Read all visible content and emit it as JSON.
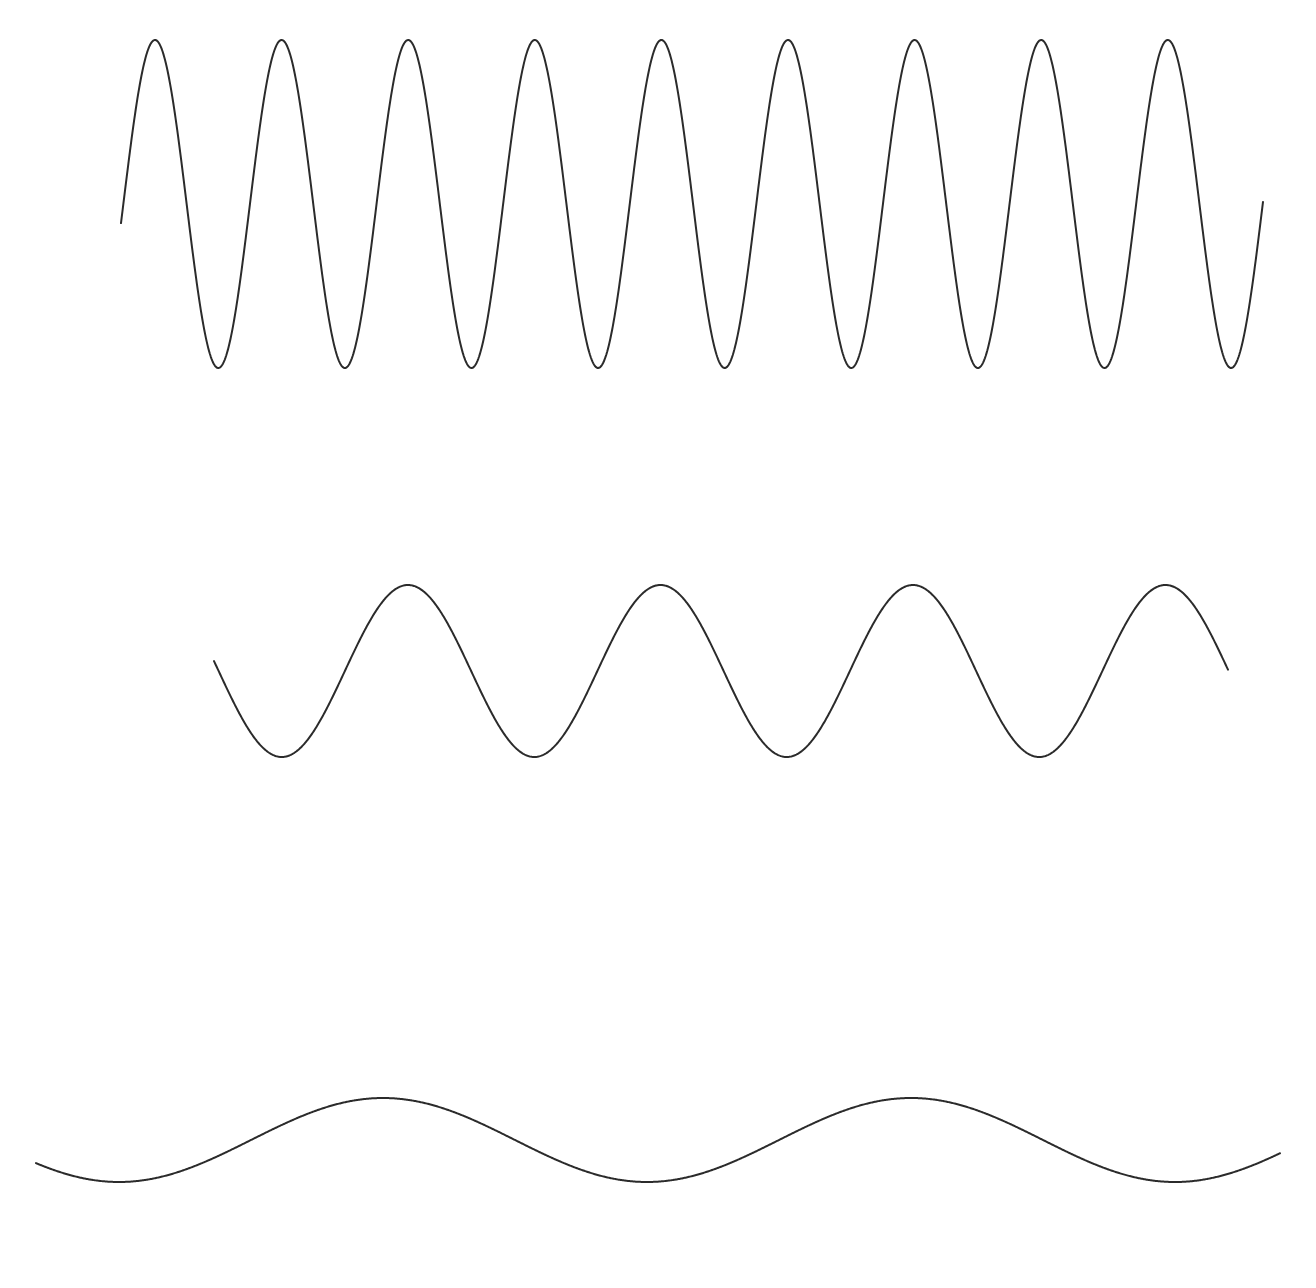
{
  "figure": {
    "background_color": "#ffffff",
    "width": 1316,
    "height": 1288
  },
  "chart_data": {
    "type": "line",
    "subtitle": "",
    "xlabel": "",
    "ylabel": "",
    "grid": false,
    "legend": "none",
    "axes_visible": false,
    "tick_labels": [],
    "annotations": [],
    "xlim": [
      0,
      1316
    ],
    "ylim": [
      0,
      1288
    ],
    "series": [
      {
        "name": "high-frequency-wave",
        "stroke_color": "#2b2b2b",
        "stroke_width": 2.0,
        "waveform": "sine",
        "x_start": 121,
        "x_end": 1263,
        "midline_y": 204,
        "amplitude": 164,
        "wavelength": 126.6,
        "first_peak_x": 155,
        "peak_count": 9,
        "peak_y": 41,
        "trough_y": 368,
        "peaks_x": [
          155,
          282,
          408,
          535,
          661,
          788,
          915,
          1041,
          1168
        ],
        "troughs_x": [
          218,
          345,
          471,
          598,
          725,
          851,
          978,
          1104,
          1231
        ],
        "samples": 1400
      },
      {
        "name": "mid-frequency-wave",
        "stroke_color": "#2b2b2b",
        "stroke_width": 2.0,
        "waveform": "sine",
        "x_start": 214,
        "x_end": 1228,
        "midline_y": 671,
        "amplitude": 86,
        "wavelength": 252.5,
        "first_peak_x": 408,
        "peak_count": 4,
        "peak_y": 585,
        "trough_y": 757,
        "peaks_x": [
          408,
          660,
          913,
          1165
        ],
        "troughs_x": [
          281,
          534,
          786,
          1039
        ],
        "samples": 1400
      },
      {
        "name": "low-frequency-wave",
        "stroke_color": "#2b2b2b",
        "stroke_width": 2.0,
        "waveform": "sine",
        "x_start": 36,
        "x_end": 1280,
        "midline_y": 1140,
        "amplitude": 42,
        "wavelength": 528,
        "first_peak_x": 383,
        "peak_count": 2,
        "peak_y": 1098,
        "trough_y": 1182,
        "peaks_x": [
          383,
          911
        ],
        "troughs_x": [
          119,
          647,
          1175
        ],
        "samples": 1400
      }
    ]
  }
}
